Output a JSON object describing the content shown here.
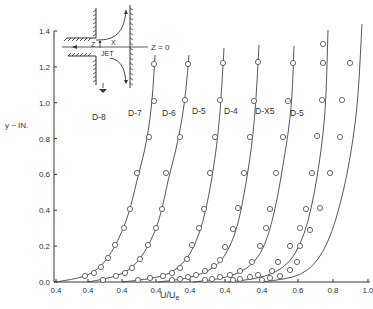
{
  "chart_data": {
    "type": "line",
    "title": "",
    "xlabel": "U/U_e",
    "ylabel": "y ~ IN.",
    "ylim": [
      0.0,
      1.4
    ],
    "grid": false,
    "legend_position": "inline labels",
    "y_ticks": [
      "0.0",
      "0.2",
      "0.4",
      "0.6",
      "0.8",
      "1.0",
      "1.2",
      "1.4"
    ],
    "x_ticks": [
      "0.4",
      "0.4",
      "0.4",
      "0.4",
      "0.4",
      "0.4",
      "0.4",
      "0.4",
      "0.6",
      "0.8",
      "1.0"
    ],
    "note": "Each profile is offset horizontally; each starts at its own 0.4 tick",
    "inset": {
      "labels": [
        "Z",
        "X",
        "JET",
        "Z = 0"
      ],
      "description": "Sketch of jet exiting a slot toward a wall; Z=0 centerline"
    },
    "series": [
      {
        "name": "D-8",
        "label_pos": [
          0.76,
          0.84
        ],
        "points_px": [
          [
            85,
            276
          ],
          [
            94,
            273
          ],
          [
            101,
            267
          ],
          [
            108,
            258
          ],
          [
            115,
            245
          ],
          [
            124,
            228
          ],
          [
            130,
            209
          ],
          [
            137,
            173
          ],
          [
            149,
            137
          ],
          [
            154,
            101
          ],
          [
            154,
            64
          ]
        ],
        "curve_px": [
          [
            56,
            282
          ],
          [
            85,
            277
          ],
          [
            100,
            268
          ],
          [
            112,
            252
          ],
          [
            122,
            232
          ],
          [
            130,
            210
          ],
          [
            137,
            180
          ],
          [
            145,
            150
          ],
          [
            150,
            120
          ],
          [
            153,
            90
          ],
          [
            155,
            55
          ]
        ]
      },
      {
        "name": "D-7",
        "label_pos": [
          0.79,
          0.84
        ],
        "points_px": [
          [
            103,
            280
          ],
          [
            116,
            276
          ],
          [
            125,
            273
          ],
          [
            132,
            268
          ],
          [
            140,
            259
          ],
          [
            148,
            245
          ],
          [
            156,
            228
          ],
          [
            162,
            209
          ],
          [
            166,
            173
          ],
          [
            180,
            137
          ],
          [
            185,
            100
          ],
          [
            188,
            64
          ]
        ],
        "curve_px": [
          [
            88,
            282
          ],
          [
            115,
            277
          ],
          [
            132,
            269
          ],
          [
            145,
            252
          ],
          [
            155,
            232
          ],
          [
            162,
            210
          ],
          [
            168,
            180
          ],
          [
            176,
            150
          ],
          [
            182,
            120
          ],
          [
            186,
            90
          ],
          [
            189,
            55
          ]
        ]
      },
      {
        "name": "D-6",
        "label_pos": [
          0.82,
          0.84
        ],
        "points_px": [
          [
            138,
            280
          ],
          [
            150,
            278
          ],
          [
            163,
            276
          ],
          [
            172,
            273
          ],
          [
            180,
            268
          ],
          [
            187,
            259
          ],
          [
            192,
            245
          ],
          [
            199,
            228
          ],
          [
            204,
            209
          ],
          [
            210,
            173
          ],
          [
            215,
            137
          ],
          [
            220,
            100
          ],
          [
            223,
            63
          ]
        ],
        "curve_px": [
          [
            122,
            282
          ],
          [
            150,
            279
          ],
          [
            170,
            274
          ],
          [
            185,
            262
          ],
          [
            195,
            245
          ],
          [
            203,
            222
          ],
          [
            209,
            195
          ],
          [
            214,
            165
          ],
          [
            218,
            135
          ],
          [
            221,
            100
          ],
          [
            224,
            48
          ]
        ]
      },
      {
        "name": "D-5",
        "label_pos": [
          0.82,
          0.84
        ],
        "points_px": [
          [
            172,
            280
          ],
          [
            180,
            279
          ],
          [
            188,
            277
          ],
          [
            196,
            275
          ],
          [
            205,
            271
          ],
          [
            214,
            266
          ],
          [
            220,
            260
          ],
          [
            225,
            247
          ],
          [
            233,
            229
          ],
          [
            238,
            208
          ],
          [
            244,
            173
          ],
          [
            250,
            137
          ],
          [
            254,
            101
          ],
          [
            258,
            62
          ]
        ],
        "curve_px": [
          [
            158,
            282
          ],
          [
            185,
            279
          ],
          [
            205,
            273
          ],
          [
            220,
            263
          ],
          [
            230,
            247
          ],
          [
            238,
            225
          ],
          [
            244,
            195
          ],
          [
            249,
            165
          ],
          [
            253,
            135
          ],
          [
            256,
            100
          ],
          [
            259,
            45
          ]
        ]
      },
      {
        "name": "D-4",
        "label_pos": [
          0.82,
          0.84
        ],
        "points_px": [
          [
            205,
            280
          ],
          [
            212,
            279
          ],
          [
            220,
            277
          ],
          [
            230,
            275
          ],
          [
            240,
            271
          ],
          [
            252,
            262
          ],
          [
            260,
            246
          ],
          [
            266,
            228
          ],
          [
            270,
            209
          ],
          [
            276,
            173
          ],
          [
            283,
            137
          ],
          [
            288,
            101
          ],
          [
            293,
            63
          ]
        ],
        "curve_px": [
          [
            193,
            282
          ],
          [
            220,
            279
          ],
          [
            240,
            273
          ],
          [
            255,
            262
          ],
          [
            265,
            245
          ],
          [
            272,
            222
          ],
          [
            278,
            195
          ],
          [
            283,
            165
          ],
          [
            288,
            135
          ],
          [
            292,
            100
          ],
          [
            294,
            46
          ]
        ]
      },
      {
        "name": "D-X5",
        "label_pos": [
          0.82,
          0.84
        ],
        "points_px": [
          [
            233,
            280
          ],
          [
            240,
            279
          ],
          [
            250,
            277
          ],
          [
            258,
            275
          ],
          [
            272,
            271
          ],
          [
            278,
            262
          ],
          [
            290,
            246
          ],
          [
            300,
            228
          ],
          [
            306,
            209
          ],
          [
            312,
            173
          ],
          [
            317,
            136
          ],
          [
            322,
            100
          ],
          [
            323,
            63
          ],
          [
            323,
            44
          ]
        ],
        "curve_px": [
          [
            228,
            282
          ],
          [
            255,
            279
          ],
          [
            275,
            273
          ],
          [
            290,
            262
          ],
          [
            300,
            245
          ],
          [
            308,
            222
          ],
          [
            314,
            195
          ],
          [
            319,
            165
          ],
          [
            323,
            135
          ],
          [
            326,
            100
          ],
          [
            328,
            30
          ]
        ]
      },
      {
        "name": "D-5",
        "label_pos": [
          0.82,
          0.84
        ],
        "points_px": [
          [
            262,
            280
          ],
          [
            270,
            278
          ],
          [
            280,
            276
          ],
          [
            290,
            270
          ],
          [
            297,
            262
          ],
          [
            300,
            246
          ],
          [
            310,
            230
          ],
          [
            320,
            208
          ],
          [
            330,
            173
          ],
          [
            340,
            137
          ],
          [
            342,
            100
          ],
          [
            350,
            63
          ]
        ],
        "curve_px": [
          [
            262,
            282
          ],
          [
            285,
            279
          ],
          [
            300,
            275
          ],
          [
            313,
            266
          ],
          [
            323,
            252
          ],
          [
            332,
            232
          ],
          [
            340,
            205
          ],
          [
            347,
            175
          ],
          [
            353,
            140
          ],
          [
            358,
            100
          ],
          [
            362,
            24
          ]
        ]
      }
    ],
    "label_px": [
      [
        92,
        120
      ],
      [
        128,
        116
      ],
      [
        162,
        116
      ],
      [
        192,
        114
      ],
      [
        224,
        114
      ],
      [
        255,
        114
      ],
      [
        290,
        116
      ]
    ]
  }
}
